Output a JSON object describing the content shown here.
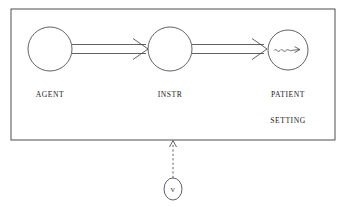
{
  "diagram": {
    "title_present": false,
    "frame": {
      "name": "setting-frame",
      "label": "SETTING",
      "x": 11,
      "y": 9,
      "width": 324,
      "height": 131
    },
    "nodes": [
      {
        "id": "agent",
        "label": "AGENT",
        "cx": 50,
        "cy": 49,
        "r": 22,
        "label_x": 50,
        "label_y": 97
      },
      {
        "id": "instr",
        "label": "INSTR",
        "cx": 170,
        "cy": 49,
        "r": 22,
        "label_x": 170,
        "label_y": 97
      },
      {
        "id": "patient",
        "label": "PATIENT",
        "cx": 288,
        "cy": 50,
        "r": 20,
        "label_x": 288,
        "label_y": 97
      }
    ],
    "edges": [
      {
        "id": "agent-to-instr",
        "from": "agent",
        "to": "instr",
        "style": "double-line-arrow"
      },
      {
        "id": "instr-to-patient",
        "from": "instr",
        "to": "patient",
        "style": "double-line-arrow"
      }
    ],
    "inner_marks": [
      {
        "id": "patient-effect-squiggle",
        "in_node": "patient",
        "style": "wavy-arrow"
      }
    ],
    "vehicle": {
      "id": "vehicle",
      "label": "V",
      "cx": 173,
      "cy": 189,
      "rx": 9,
      "ry": 11,
      "connector_style": "dashed-open-arrow-up",
      "connector_from_y": 178,
      "connector_to_y": 141
    },
    "colors": {
      "background": "#ffffff",
      "stroke": "#3a3a3a",
      "text": "#1a1a1a"
    }
  }
}
